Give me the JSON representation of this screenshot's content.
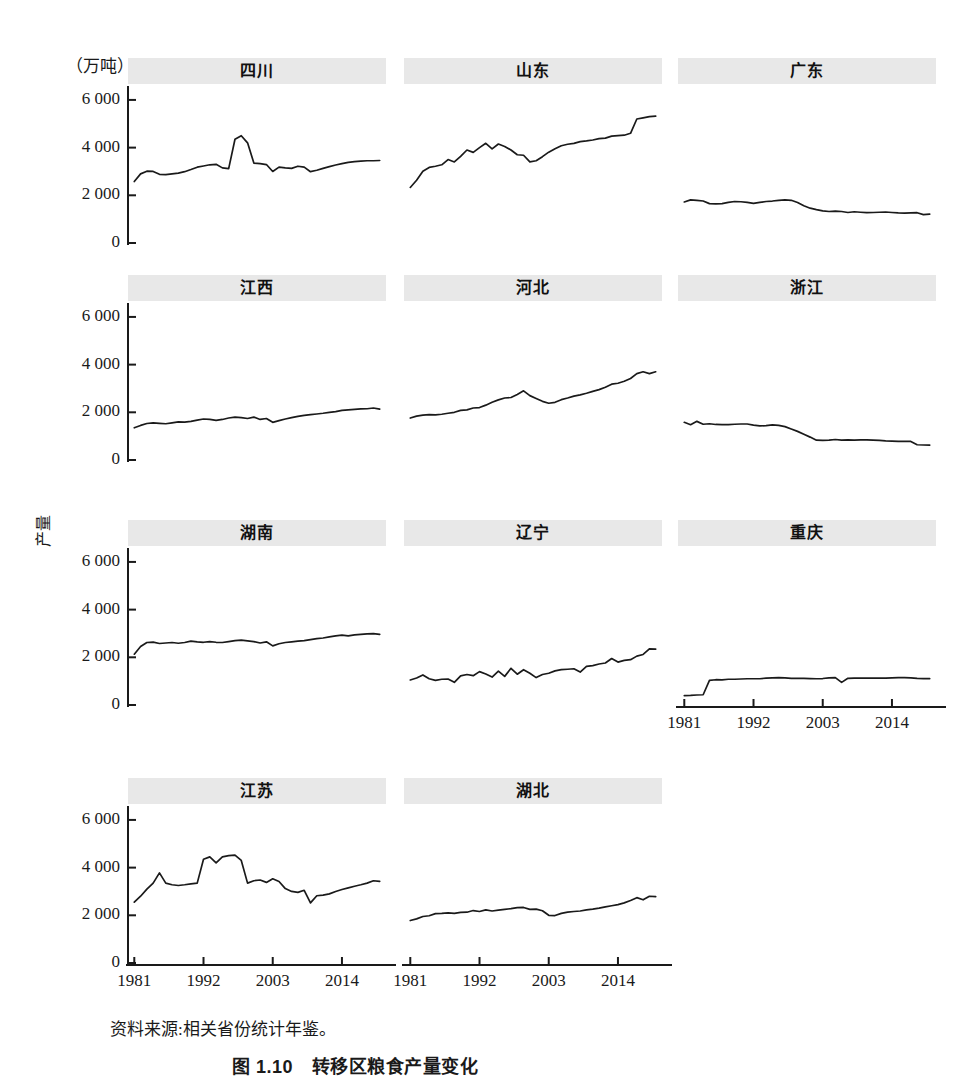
{
  "figure": {
    "unit_label": "（万吨）",
    "y_axis_title": "产量",
    "source_note": "资料来源:相关省份统计年鉴。",
    "caption": "图 1.10　转移区粮食产量变化",
    "line_color": "#1a1a1a",
    "title_band_color": "#e8e8e8",
    "axis_color": "#1a1a1a"
  },
  "axes": {
    "y_ticks": [
      "0",
      "2 000",
      "4 000",
      "6 000"
    ],
    "y_tick_values": [
      0,
      2000,
      4000,
      6000
    ],
    "y_lim": [
      0,
      6500
    ],
    "x_ticks": [
      "1981",
      "1992",
      "2003",
      "2014"
    ],
    "x_tick_values": [
      1981,
      1992,
      2003,
      2014
    ],
    "x_lim": [
      1980,
      2021
    ]
  },
  "chart_data": {
    "type": "line",
    "title": "图 1.10　转移区粮食产量变化",
    "xlabel": "",
    "ylabel": "产量",
    "unit": "万吨",
    "ylim": [
      0,
      6500
    ],
    "xlim": [
      1980,
      2021
    ],
    "grid": false,
    "legend": "none",
    "x": [
      1981,
      1982,
      1983,
      1984,
      1985,
      1986,
      1987,
      1988,
      1989,
      1990,
      1991,
      1992,
      1993,
      1994,
      1995,
      1996,
      1997,
      1998,
      1999,
      2000,
      2001,
      2002,
      2003,
      2004,
      2005,
      2006,
      2007,
      2008,
      2009,
      2010,
      2011,
      2012,
      2013,
      2014,
      2015,
      2016,
      2017,
      2018,
      2019,
      2020
    ],
    "panels": [
      {
        "name": "四川",
        "row": 0,
        "col": 0,
        "show_yaxis": true,
        "show_xaxis": false,
        "values": [
          2580,
          2900,
          3010,
          3000,
          2880,
          2870,
          2900,
          2930,
          2990,
          3080,
          3180,
          3230,
          3280,
          3300,
          3150,
          3120,
          4350,
          4500,
          4200,
          3350,
          3330,
          3290,
          3000,
          3180,
          3150,
          3130,
          3220,
          3180,
          2990,
          3050,
          3130,
          3200,
          3270,
          3330,
          3380,
          3410,
          3430,
          3450,
          3450,
          3460
        ]
      },
      {
        "name": "山东",
        "row": 0,
        "col": 1,
        "show_yaxis": false,
        "show_xaxis": false,
        "values": [
          2330,
          2630,
          3010,
          3170,
          3220,
          3280,
          3500,
          3400,
          3630,
          3900,
          3800,
          4000,
          4180,
          3950,
          4150,
          4050,
          3900,
          3700,
          3680,
          3400,
          3450,
          3620,
          3810,
          3950,
          4080,
          4140,
          4180,
          4250,
          4280,
          4320,
          4380,
          4400,
          4480,
          4500,
          4520,
          4600,
          5200,
          5250,
          5300,
          5320
        ]
      },
      {
        "name": "广东",
        "row": 0,
        "col": 2,
        "show_yaxis": false,
        "show_xaxis": false,
        "values": [
          1720,
          1810,
          1790,
          1760,
          1650,
          1640,
          1650,
          1700,
          1740,
          1730,
          1700,
          1660,
          1700,
          1740,
          1760,
          1790,
          1810,
          1790,
          1700,
          1560,
          1460,
          1400,
          1350,
          1320,
          1340,
          1320,
          1280,
          1310,
          1290,
          1270,
          1280,
          1290,
          1300,
          1280,
          1260,
          1250,
          1260,
          1270,
          1190,
          1210
        ]
      },
      {
        "name": "江西",
        "row": 1,
        "col": 0,
        "show_yaxis": true,
        "show_xaxis": false,
        "values": [
          1350,
          1450,
          1530,
          1560,
          1540,
          1520,
          1560,
          1600,
          1590,
          1620,
          1670,
          1720,
          1700,
          1660,
          1700,
          1760,
          1800,
          1780,
          1740,
          1800,
          1700,
          1740,
          1580,
          1650,
          1720,
          1780,
          1830,
          1870,
          1900,
          1930,
          1960,
          2000,
          2030,
          2080,
          2100,
          2120,
          2140,
          2150,
          2180,
          2130
        ]
      },
      {
        "name": "河北",
        "row": 1,
        "col": 1,
        "show_yaxis": false,
        "show_xaxis": false,
        "values": [
          1760,
          1840,
          1880,
          1900,
          1890,
          1920,
          1960,
          2000,
          2080,
          2100,
          2180,
          2200,
          2300,
          2420,
          2520,
          2600,
          2620,
          2750,
          2900,
          2700,
          2580,
          2460,
          2380,
          2420,
          2530,
          2600,
          2680,
          2730,
          2800,
          2880,
          2950,
          3050,
          3180,
          3220,
          3300,
          3420,
          3620,
          3700,
          3620,
          3700
        ]
      },
      {
        "name": "浙江",
        "row": 1,
        "col": 2,
        "show_yaxis": false,
        "show_xaxis": false,
        "values": [
          1580,
          1480,
          1620,
          1500,
          1520,
          1490,
          1480,
          1480,
          1500,
          1510,
          1510,
          1460,
          1430,
          1440,
          1470,
          1450,
          1400,
          1300,
          1200,
          1080,
          960,
          830,
          820,
          830,
          860,
          830,
          840,
          830,
          840,
          840,
          830,
          820,
          800,
          790,
          780,
          780,
          780,
          640,
          630,
          620
        ]
      },
      {
        "name": "湖南",
        "row": 2,
        "col": 0,
        "show_yaxis": true,
        "show_xaxis": false,
        "values": [
          2130,
          2450,
          2620,
          2640,
          2580,
          2600,
          2620,
          2590,
          2620,
          2680,
          2650,
          2630,
          2660,
          2630,
          2620,
          2660,
          2700,
          2720,
          2690,
          2660,
          2600,
          2650,
          2480,
          2570,
          2620,
          2650,
          2680,
          2700,
          2740,
          2780,
          2810,
          2860,
          2900,
          2930,
          2900,
          2940,
          2960,
          2980,
          2990,
          2960
        ]
      },
      {
        "name": "辽宁",
        "row": 2,
        "col": 1,
        "show_yaxis": false,
        "show_xaxis": false,
        "values": [
          1050,
          1130,
          1260,
          1100,
          1030,
          1080,
          1090,
          950,
          1220,
          1280,
          1230,
          1400,
          1300,
          1170,
          1420,
          1200,
          1540,
          1290,
          1480,
          1330,
          1150,
          1280,
          1330,
          1430,
          1480,
          1500,
          1520,
          1380,
          1620,
          1650,
          1720,
          1760,
          1950,
          1800,
          1870,
          1900,
          2050,
          2120,
          2350,
          2340
        ]
      },
      {
        "name": "重庆",
        "row": 2,
        "col": 2,
        "show_yaxis": false,
        "show_xaxis": true,
        "values": [
          390,
          400,
          420,
          430,
          1030,
          1060,
          1050,
          1080,
          1080,
          1090,
          1100,
          1100,
          1100,
          1130,
          1140,
          1150,
          1140,
          1120,
          1120,
          1120,
          1110,
          1100,
          1110,
          1140,
          1150,
          950,
          1120,
          1130,
          1130,
          1130,
          1130,
          1130,
          1130,
          1140,
          1150,
          1150,
          1140,
          1120,
          1110,
          1110
        ]
      },
      {
        "name": "江苏",
        "row": 3,
        "col": 0,
        "show_yaxis": true,
        "show_xaxis": true,
        "values": [
          2550,
          2800,
          3100,
          3350,
          3780,
          3350,
          3280,
          3250,
          3280,
          3320,
          3350,
          4350,
          4450,
          4200,
          4450,
          4500,
          4520,
          4300,
          3350,
          3450,
          3480,
          3380,
          3530,
          3420,
          3120,
          3000,
          2960,
          3050,
          2520,
          2820,
          2850,
          2900,
          3000,
          3080,
          3150,
          3220,
          3280,
          3350,
          3450,
          3420,
          3500,
          3550,
          3600,
          3650
        ]
      },
      {
        "name": "湖北",
        "row": 3,
        "col": 1,
        "show_yaxis": false,
        "show_xaxis": true,
        "values": [
          1780,
          1850,
          1950,
          1980,
          2070,
          2080,
          2100,
          2080,
          2120,
          2130,
          2200,
          2160,
          2230,
          2180,
          2220,
          2250,
          2280,
          2320,
          2330,
          2250,
          2260,
          2190,
          2000,
          1990,
          2080,
          2130,
          2160,
          2180,
          2230,
          2260,
          2300,
          2350,
          2400,
          2450,
          2520,
          2620,
          2740,
          2650,
          2800,
          2780
        ]
      }
    ]
  }
}
